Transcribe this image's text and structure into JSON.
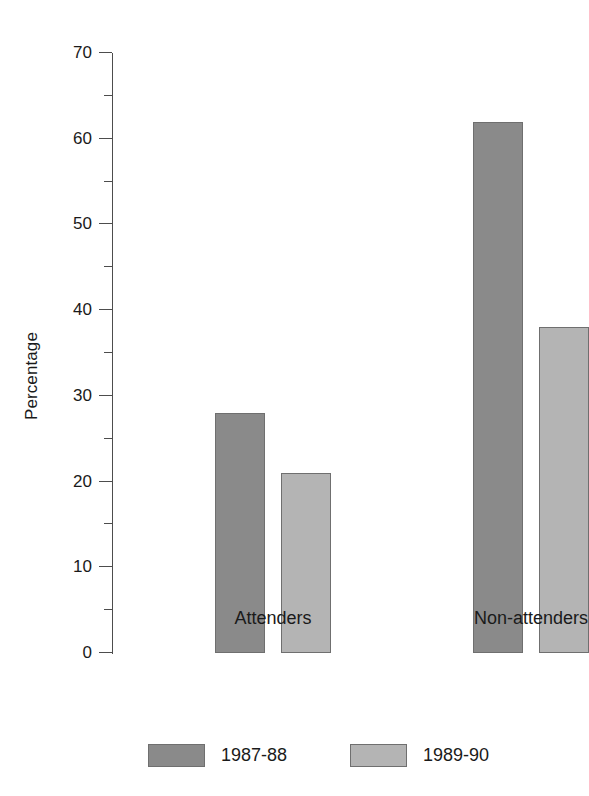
{
  "chart_data": {
    "type": "bar",
    "title": "",
    "subtitle": "",
    "xlabel": "",
    "ylabel": "Percentage",
    "categories": [
      "Attenders",
      "Non-attenders"
    ],
    "series": [
      {
        "name": "1987-88",
        "color": "#8a8a8a",
        "values": [
          28,
          62
        ]
      },
      {
        "name": "1989-90",
        "color": "#b4b4b4",
        "values": [
          21,
          38
        ]
      }
    ],
    "ylim": [
      0,
      70
    ],
    "ytick_step": 10,
    "yminor_step": 5,
    "ytick_labels": [
      "0",
      "10",
      "20",
      "30",
      "40",
      "50",
      "60",
      "70"
    ],
    "ytick_values": [
      0,
      10,
      20,
      30,
      40,
      50,
      60,
      70
    ],
    "yminor_values": [
      5,
      15,
      25,
      35,
      45,
      55,
      65
    ],
    "grid": false,
    "legend_position": "bottom",
    "background": "#ffffff",
    "axis_color": "#4d4d4d",
    "bar_edge_color": "#6f6f6f",
    "text_color": "#1a1a1a"
  }
}
